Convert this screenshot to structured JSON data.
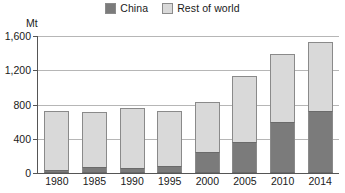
{
  "chart_data": {
    "type": "bar",
    "subtype": "stacked-vertical",
    "title": "",
    "xlabel": "",
    "ylabel": "Mt",
    "ylim": [
      0,
      1600
    ],
    "yticks": [
      0,
      400,
      800,
      1200,
      1600
    ],
    "ytick_labels": [
      "0",
      "400",
      "800",
      "1,200",
      "1,600"
    ],
    "grid": true,
    "legend_position": "top-center",
    "categories": [
      "1980",
      "1985",
      "1990",
      "1995",
      "2000",
      "2005",
      "2010",
      "2014"
    ],
    "series": [
      {
        "name": "China",
        "color": "#7b7b7b",
        "values": [
          40,
          70,
          55,
          85,
          250,
          360,
          600,
          725
        ]
      },
      {
        "name": "Rest of world",
        "color": "#d9d9d9",
        "values": [
          680,
          645,
          705,
          640,
          585,
          770,
          795,
          805
        ]
      }
    ],
    "totals": [
      720,
      715,
      760,
      725,
      835,
      1130,
      1395,
      1530
    ]
  },
  "legend": {
    "items": [
      {
        "label": "China",
        "color": "#7b7b7b"
      },
      {
        "label": "Rest of world",
        "color": "#d9d9d9"
      }
    ]
  },
  "axis": {
    "unit": "Mt"
  }
}
